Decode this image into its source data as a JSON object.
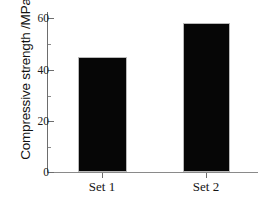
{
  "chart_data": {
    "type": "bar",
    "title": "",
    "xlabel": "",
    "ylabel": "Compressive strength /MPa",
    "categories": [
      "Set 1",
      "Set 2"
    ],
    "values": [
      45,
      58
    ],
    "ylim": [
      0,
      63
    ],
    "ymajor_ticks": [
      0,
      20,
      40,
      60
    ],
    "yminor_ticks": [
      10,
      30,
      50
    ],
    "ytick_labels": [
      "0",
      "20",
      "40",
      "60"
    ],
    "grid": false,
    "legend": null,
    "bar_color": "#060606",
    "axis_color": "#6d6d6d"
  }
}
